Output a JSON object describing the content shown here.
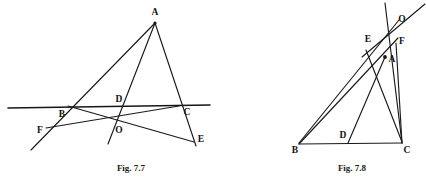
{
  "page": {
    "background_color": "#ffffff",
    "ink_color": "#1a1a1a",
    "width": 426,
    "height": 187
  },
  "figures": [
    {
      "id": "fig-7-7",
      "caption": "Fig. 7.7",
      "caption_pos": {
        "x": 131,
        "y": 171
      },
      "description": "Triangle ABC cut by a transversal line through B, D and C with cevians meeting at O; the transversal extends beyond the triangle to F on the left and E on the right.",
      "points": [
        {
          "name": "A",
          "x": 155,
          "y": 22,
          "label": "A",
          "label_x": 155,
          "label_y": 13,
          "dot": true
        },
        {
          "name": "B",
          "x": 68,
          "y": 106.5,
          "label": "B",
          "label_x": 62,
          "label_y": 115,
          "dot": false
        },
        {
          "name": "C",
          "x": 178.5,
          "y": 106.5,
          "label": "C",
          "label_x": 187,
          "label_y": 113,
          "dot": false
        },
        {
          "name": "D",
          "x": 123,
          "y": 106.5,
          "label": "D",
          "label_x": 119,
          "label_y": 100,
          "dot": false
        },
        {
          "name": "O",
          "x": 117,
          "y": 122,
          "label": "O",
          "label_x": 119,
          "label_y": 131,
          "dot": false
        },
        {
          "name": "E",
          "x": 193.5,
          "y": 141,
          "label": "E",
          "label_x": 201,
          "label_y": 140,
          "dot": false
        },
        {
          "name": "F",
          "x": 46,
          "y": 128,
          "label": "F",
          "label_x": 40,
          "label_y": 131,
          "dot": false
        }
      ],
      "segments": [
        {
          "name": "horizontal-transversal",
          "from": [
            8,
            108
          ],
          "to": [
            210,
            105
          ],
          "weight": "thick"
        },
        {
          "name": "side-AB-extended",
          "from": [
            155,
            23
          ],
          "to": [
            31,
            150
          ],
          "weight": "normal"
        },
        {
          "name": "side-AC-extended",
          "from": [
            155,
            23
          ],
          "to": [
            196,
            146
          ],
          "weight": "normal"
        },
        {
          "name": "cevian-AO-extended",
          "from": [
            155,
            23
          ],
          "to": [
            108,
            144
          ],
          "weight": "normal"
        },
        {
          "name": "line-B-to-E",
          "from": [
            68,
            106
          ],
          "to": [
            194,
            142
          ],
          "weight": "normal"
        },
        {
          "name": "line-F-to-C",
          "from": [
            46,
            128
          ],
          "to": [
            179,
            106
          ],
          "weight": "normal"
        }
      ]
    },
    {
      "id": "fig-7-8",
      "caption": "Fig. 7.8",
      "caption_pos": {
        "x": 352,
        "y": 171
      },
      "description": "Triangle ABC with base BC; cevians from B and C cross at A-region forming points E, F and O above the triangle, with D on base BC.",
      "points": [
        {
          "name": "O",
          "x": 396,
          "y": 23,
          "label": "O",
          "label_x": 402,
          "label_y": 20,
          "dot": false
        },
        {
          "name": "E",
          "x": 374,
          "y": 41,
          "label": "E",
          "label_x": 368,
          "label_y": 40,
          "dot": false
        },
        {
          "name": "F",
          "x": 396,
          "y": 43,
          "label": "F",
          "label_x": 402,
          "label_y": 42,
          "dot": false
        },
        {
          "name": "A",
          "x": 385,
          "y": 57,
          "label": "A",
          "label_x": 392,
          "label_y": 60,
          "dot": true
        },
        {
          "name": "D",
          "x": 348,
          "y": 143,
          "label": "D",
          "label_x": 343,
          "label_y": 136,
          "dot": false
        },
        {
          "name": "B",
          "x": 299,
          "y": 143,
          "label": "B",
          "label_x": 295,
          "label_y": 151,
          "dot": false
        },
        {
          "name": "C",
          "x": 402,
          "y": 143,
          "label": "C",
          "label_x": 407,
          "label_y": 151,
          "dot": false
        }
      ],
      "segments": [
        {
          "name": "base-BC",
          "from": [
            299,
            144
          ],
          "to": [
            402,
            143
          ],
          "weight": "normal"
        },
        {
          "name": "side-BA-to-O",
          "from": [
            299,
            143
          ],
          "to": [
            399,
            20
          ],
          "weight": "normal"
        },
        {
          "name": "side-BF-line",
          "from": [
            299,
            144
          ],
          "to": [
            398,
            38
          ],
          "weight": "normal"
        },
        {
          "name": "side-CA-extended",
          "from": [
            402,
            143
          ],
          "to": [
            385,
            3
          ],
          "weight": "normal"
        },
        {
          "name": "cevian-C-to-E",
          "from": [
            402,
            142
          ],
          "to": [
            366,
            50
          ],
          "weight": "normal"
        },
        {
          "name": "cevian-A-to-D",
          "from": [
            385,
            57
          ],
          "to": [
            348,
            143
          ],
          "weight": "normal"
        },
        {
          "name": "ray-through-O",
          "from": [
            362,
            57
          ],
          "to": [
            425,
            4
          ],
          "weight": "normal"
        },
        {
          "name": "short-seg-F-to-C",
          "from": [
            396,
            43
          ],
          "to": [
            402,
            143
          ],
          "weight": "normal"
        }
      ]
    }
  ]
}
